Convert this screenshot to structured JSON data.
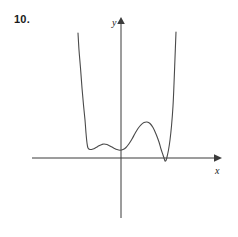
{
  "figure": {
    "problem_number": "10.",
    "background_color": "#ffffff",
    "curve_color": "#4a4a4a",
    "axis_color": "#3b3b3b"
  },
  "axes": {
    "x_label": "x",
    "y_label": "y",
    "x_axis_y_px": 158,
    "y_axis_x_px": 121,
    "x_axis_start_px": 32,
    "x_axis_end_px": 222,
    "y_axis_top_px": 18,
    "y_axis_bottom_px": 218,
    "arrowheads": [
      "x-axis-right",
      "y-axis-up"
    ],
    "ticks": [],
    "tick_labels": [],
    "grid": false
  },
  "chart_data": {
    "type": "line",
    "title": "",
    "subtitle": "",
    "xlabel": "x",
    "ylabel": "y",
    "grid": false,
    "legend": null,
    "annotations": [],
    "features": {
      "local_minima_px": [
        [
          88,
          148
        ],
        [
          120,
          150
        ],
        [
          165,
          161
        ]
      ],
      "local_maxima_px": [
        [
          104,
          144
        ],
        [
          147,
          122
        ]
      ],
      "x_intercepts_px": [
        160,
        170
      ],
      "left_branch_top_px": [
        78,
        33
      ],
      "right_branch_top_px": [
        176,
        32
      ]
    },
    "path_points_px": [
      [
        78,
        33
      ],
      [
        79,
        50
      ],
      [
        80.5,
        68
      ],
      [
        82,
        88
      ],
      [
        83.5,
        105
      ],
      [
        85,
        120
      ],
      [
        86,
        133
      ],
      [
        87,
        143
      ],
      [
        88,
        148
      ],
      [
        90,
        149.5
      ],
      [
        93,
        149
      ],
      [
        96,
        147.5
      ],
      [
        99,
        145.8
      ],
      [
        102,
        144.4
      ],
      [
        104,
        144.0
      ],
      [
        107,
        144.6
      ],
      [
        110,
        146
      ],
      [
        114,
        148.2
      ],
      [
        117,
        149.6
      ],
      [
        120,
        150.2
      ],
      [
        123,
        149.6
      ],
      [
        126,
        147.5
      ],
      [
        129,
        143.8
      ],
      [
        132,
        139
      ],
      [
        135,
        133.5
      ],
      [
        138,
        128.5
      ],
      [
        141,
        124.8
      ],
      [
        144,
        122.5
      ],
      [
        147,
        122.0
      ],
      [
        150,
        123.5
      ],
      [
        153,
        127.5
      ],
      [
        156,
        134
      ],
      [
        159,
        142
      ],
      [
        161,
        149
      ],
      [
        163,
        155
      ],
      [
        164.5,
        159.5
      ],
      [
        165,
        161
      ],
      [
        166,
        160.5
      ],
      [
        167,
        157
      ],
      [
        168.5,
        150
      ],
      [
        170,
        140
      ],
      [
        171.5,
        126
      ],
      [
        173,
        106
      ],
      [
        174,
        84
      ],
      [
        175,
        58
      ],
      [
        176,
        32
      ]
    ]
  }
}
